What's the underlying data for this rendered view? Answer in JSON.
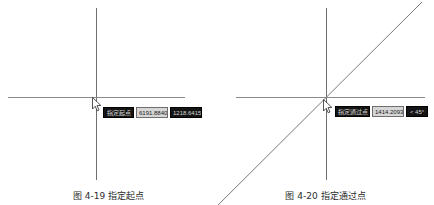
{
  "figures": [
    {
      "id": "figure-left",
      "caption": "图 4-19  指定起点",
      "axes": {
        "vertical": {
          "x": 96,
          "y_top": 8,
          "y_bottom": 180
        },
        "horizontal": {
          "y": 97,
          "x_left": 8,
          "x_right": 185
        }
      },
      "cursor": {
        "x": 92,
        "y": 97
      },
      "dynamic_inputs": [
        {
          "name": "prompt",
          "text": "指定起点",
          "style": "dark",
          "x": 103,
          "y": 107,
          "w": 31
        },
        {
          "name": "length",
          "text": "6191.8840",
          "style": "light",
          "x": 136,
          "y": 107,
          "w": 32
        },
        {
          "name": "coordinate",
          "text": "1218.6415",
          "style": "dark",
          "x": 170,
          "y": 107,
          "w": 32
        }
      ],
      "has_ray": false
    },
    {
      "id": "figure-right",
      "caption": "图 4-20  指定通过点",
      "axes": {
        "vertical": {
          "x": 109,
          "y_top": 8,
          "y_bottom": 180
        },
        "horizontal": {
          "y": 97,
          "x_left": 19,
          "x_right": 208
        }
      },
      "cursor": {
        "x": 106,
        "y": 99
      },
      "ray": {
        "x1": -24,
        "y1": 230,
        "x2": 205,
        "y2": 2,
        "angle_label": "45°"
      },
      "dynamic_inputs": [
        {
          "name": "prompt",
          "text": "指定通过点",
          "style": "dark",
          "x": 118,
          "y": 106,
          "w": 35
        },
        {
          "name": "length",
          "text": "1414.2093",
          "style": "light",
          "x": 155,
          "y": 106,
          "w": 32
        },
        {
          "name": "angle",
          "text": "< 45°",
          "style": "dark",
          "x": 189,
          "y": 106,
          "w": 22
        }
      ],
      "has_ray": true
    }
  ]
}
